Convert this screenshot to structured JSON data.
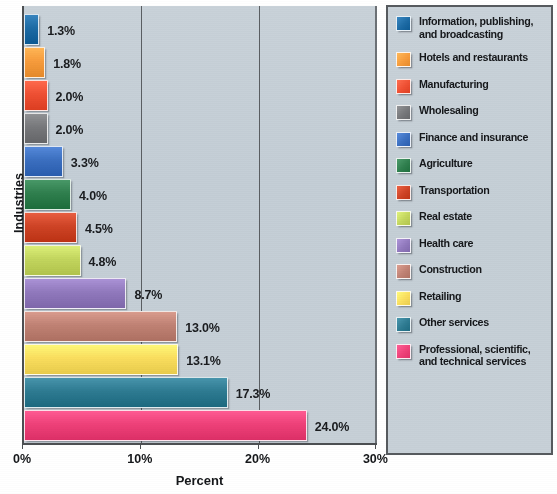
{
  "chart_data": {
    "type": "bar",
    "orientation": "horizontal",
    "title": "",
    "xlabel": "Percent",
    "ylabel": "Industries",
    "xlim": [
      0,
      30
    ],
    "xticks": [
      "0%",
      "10%",
      "20%",
      "30%"
    ],
    "xtick_values": [
      0,
      10,
      20,
      30
    ],
    "grid": true,
    "grid_axis": "x",
    "legend_position": "right",
    "categories": [
      "Information, publishing, and broadcasting",
      "Hotels and restaurants",
      "Manufacturing",
      "Wholesaling",
      "Finance and insurance",
      "Agriculture",
      "Transportation",
      "Real estate",
      "Health care",
      "Construction",
      "Retailing",
      "Other services",
      "Professional, scientific, and technical services"
    ],
    "values": [
      1.3,
      1.8,
      2.0,
      2.0,
      3.3,
      4.0,
      4.5,
      4.8,
      8.7,
      13.0,
      13.1,
      17.3,
      24.0
    ],
    "data_labels": [
      "1.3%",
      "1.8%",
      "2.0%",
      "2.0%",
      "3.3%",
      "4.0%",
      "4.5%",
      "4.8%",
      "8.7%",
      "13.0%",
      "13.1%",
      "17.3%",
      "24.0%"
    ],
    "colors": [
      "#1d6ba5",
      "#f79c3c",
      "#ef5033",
      "#77787b",
      "#3b6fc0",
      "#2f7f4e",
      "#cf4426",
      "#c3d65e",
      "#9179bd",
      "#c08274",
      "#fade5e",
      "#2e7b92",
      "#ef4179"
    ]
  },
  "axes": {
    "x_title": "Percent",
    "y_title": "Industries",
    "ticks": [
      {
        "label": "0%",
        "value": 0
      },
      {
        "label": "10%",
        "value": 10
      },
      {
        "label": "20%",
        "value": 20
      },
      {
        "label": "30%",
        "value": 30
      }
    ]
  },
  "legend": {
    "items": [
      {
        "label": "Information, publishing,\nand broadcasting",
        "color": "#1d6ba5"
      },
      {
        "label": "Hotels and restaurants",
        "color": "#f79c3c"
      },
      {
        "label": "Manufacturing",
        "color": "#ef5033"
      },
      {
        "label": "Wholesaling",
        "color": "#77787b"
      },
      {
        "label": "Finance and insurance",
        "color": "#3b6fc0"
      },
      {
        "label": "Agriculture",
        "color": "#2f7f4e"
      },
      {
        "label": "Transportation",
        "color": "#cf4426"
      },
      {
        "label": "Real estate",
        "color": "#c3d65e"
      },
      {
        "label": "Health care",
        "color": "#9179bd"
      },
      {
        "label": "Construction",
        "color": "#c08274"
      },
      {
        "label": "Retailing",
        "color": "#fade5e"
      },
      {
        "label": "Other services",
        "color": "#2e7b92"
      },
      {
        "label": "Professional, scientific,\nand technical services",
        "color": "#ef4179"
      }
    ]
  },
  "style": {
    "plot_background": "#c6cfd7",
    "axis_color": "#4c4f52",
    "text_color": "#15171a"
  }
}
